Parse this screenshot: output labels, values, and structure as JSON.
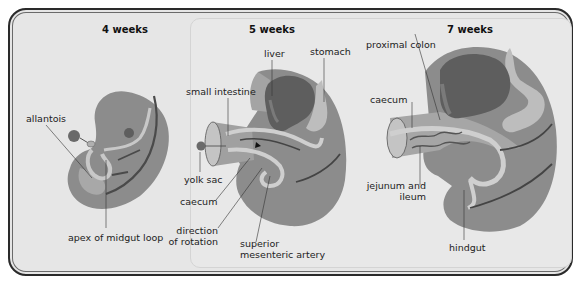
{
  "figure": {
    "stages": [
      {
        "title": "4 weeks",
        "labels": {
          "allantois": "allantois",
          "apex": "apex of midgut loop"
        }
      },
      {
        "title": "5 weeks",
        "labels": {
          "liver": "liver",
          "stomach": "stomach",
          "small_intestine": "small intestine",
          "yolk_sac": "yolk sac",
          "caecum": "caecum",
          "direction_line1": "direction",
          "direction_line2": "of rotation",
          "sma_line1": "superior",
          "sma_line2": "mesenteric artery"
        }
      },
      {
        "title": "7 weeks",
        "labels": {
          "proximal_colon": "proximal colon",
          "caecum": "caecum",
          "jejunum_line1": "jejunum and",
          "jejunum_line2": "ileum",
          "hindgut": "hindgut"
        }
      }
    ],
    "colors": {
      "frame_border": "#2a2a2a",
      "background": "#e6e6e6",
      "body_dark": "#8c8c8c",
      "body_mid": "#a6a6a6",
      "gut_light": "#c8c8c8",
      "liver": "#5e5e5e",
      "vessel": "#444444"
    }
  }
}
